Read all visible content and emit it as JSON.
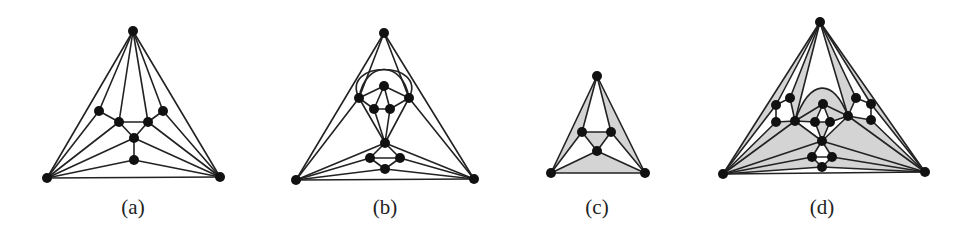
{
  "figure": {
    "panels": [
      {
        "id": "a",
        "label": "(a)",
        "label_pos": [
          133,
          214
        ],
        "nodes": [
          [
            133,
            31
          ],
          [
            47,
            178
          ],
          [
            220,
            177
          ],
          [
            99,
            111
          ],
          [
            119,
            122
          ],
          [
            148,
            122
          ],
          [
            163,
            111
          ],
          [
            134,
            138
          ],
          [
            134,
            160
          ]
        ],
        "edges": [
          [
            0,
            1
          ],
          [
            0,
            2
          ],
          [
            1,
            2
          ],
          [
            0,
            3
          ],
          [
            0,
            4
          ],
          [
            0,
            5
          ],
          [
            0,
            6
          ],
          [
            1,
            3
          ],
          [
            1,
            4
          ],
          [
            1,
            7
          ],
          [
            1,
            8
          ],
          [
            2,
            6
          ],
          [
            2,
            5
          ],
          [
            2,
            7
          ],
          [
            2,
            8
          ],
          [
            3,
            4
          ],
          [
            4,
            5
          ],
          [
            5,
            6
          ],
          [
            4,
            7
          ],
          [
            5,
            7
          ],
          [
            7,
            8
          ]
        ],
        "faces": [],
        "curves": []
      },
      {
        "id": "b",
        "label": "(b)",
        "label_pos": [
          385,
          214
        ],
        "nodes": [
          [
            384,
            33
          ],
          [
            296,
            180
          ],
          [
            474,
            179
          ],
          [
            359,
            98
          ],
          [
            409,
            98
          ],
          [
            384,
            86
          ],
          [
            374,
            109
          ],
          [
            390,
            109
          ],
          [
            385,
            143
          ],
          [
            370,
            158
          ],
          [
            400,
            158
          ],
          [
            385,
            169
          ]
        ],
        "edges": [
          [
            0,
            1
          ],
          [
            0,
            2
          ],
          [
            1,
            2
          ],
          [
            0,
            3
          ],
          [
            0,
            4
          ],
          [
            1,
            3
          ],
          [
            2,
            4
          ],
          [
            3,
            5
          ],
          [
            4,
            5
          ],
          [
            3,
            6
          ],
          [
            4,
            7
          ],
          [
            5,
            6
          ],
          [
            5,
            7
          ],
          [
            6,
            7
          ],
          [
            3,
            8
          ],
          [
            4,
            8
          ],
          [
            6,
            8
          ],
          [
            7,
            8
          ],
          [
            1,
            8
          ],
          [
            2,
            8
          ],
          [
            1,
            9
          ],
          [
            1,
            11
          ],
          [
            2,
            10
          ],
          [
            2,
            11
          ],
          [
            8,
            9
          ],
          [
            8,
            10
          ],
          [
            9,
            10
          ],
          [
            9,
            11
          ],
          [
            10,
            11
          ]
        ],
        "faces": [],
        "curves": [
          "M 359 98 C 365 60, 403 60, 409 98",
          "M 359 98 C 340 60, 428 60, 409 98"
        ]
      },
      {
        "id": "c",
        "label": "(c)",
        "label_pos": [
          597,
          214
        ],
        "nodes": [
          [
            597,
            76
          ],
          [
            551,
            173
          ],
          [
            645,
            173
          ],
          [
            582,
            132
          ],
          [
            611,
            132
          ],
          [
            597,
            151
          ]
        ],
        "edges": [
          [
            0,
            1
          ],
          [
            0,
            2
          ],
          [
            1,
            2
          ],
          [
            0,
            3
          ],
          [
            0,
            4
          ],
          [
            1,
            3
          ],
          [
            2,
            4
          ],
          [
            3,
            4
          ],
          [
            3,
            5
          ],
          [
            4,
            5
          ],
          [
            1,
            5
          ],
          [
            2,
            5
          ]
        ],
        "faces": [
          [
            0,
            1,
            3
          ],
          [
            0,
            2,
            4
          ],
          [
            3,
            4,
            5
          ],
          [
            1,
            2,
            5
          ]
        ],
        "curves": []
      },
      {
        "id": "d",
        "label": "(d)",
        "label_pos": [
          822,
          214
        ],
        "nodes": [
          [
            820,
            22
          ],
          [
            723,
            174
          ],
          [
            925,
            172
          ],
          [
            776,
            105
          ],
          [
            790,
            98
          ],
          [
            776,
            122
          ],
          [
            795,
            121
          ],
          [
            823,
            104
          ],
          [
            815,
            122
          ],
          [
            830,
            122
          ],
          [
            848,
            116
          ],
          [
            856,
            98
          ],
          [
            871,
            104
          ],
          [
            871,
            120
          ],
          [
            822,
            141
          ],
          [
            812,
            157
          ],
          [
            832,
            157
          ],
          [
            822,
            167
          ]
        ],
        "edges": [
          [
            0,
            1
          ],
          [
            0,
            2
          ],
          [
            1,
            2
          ],
          [
            0,
            3
          ],
          [
            0,
            4
          ],
          [
            0,
            6
          ],
          [
            0,
            10
          ],
          [
            0,
            11
          ],
          [
            0,
            12
          ],
          [
            1,
            3
          ],
          [
            1,
            5
          ],
          [
            1,
            6
          ],
          [
            1,
            14
          ],
          [
            1,
            15
          ],
          [
            1,
            17
          ],
          [
            2,
            12
          ],
          [
            2,
            13
          ],
          [
            2,
            10
          ],
          [
            2,
            14
          ],
          [
            2,
            16
          ],
          [
            2,
            17
          ],
          [
            3,
            4
          ],
          [
            3,
            5
          ],
          [
            4,
            6
          ],
          [
            5,
            6
          ],
          [
            6,
            8
          ],
          [
            6,
            7
          ],
          [
            7,
            8
          ],
          [
            7,
            9
          ],
          [
            8,
            9
          ],
          [
            9,
            10
          ],
          [
            7,
            10
          ],
          [
            10,
            11
          ],
          [
            11,
            12
          ],
          [
            12,
            13
          ],
          [
            10,
            13
          ],
          [
            8,
            14
          ],
          [
            9,
            14
          ],
          [
            6,
            14
          ],
          [
            10,
            14
          ],
          [
            14,
            15
          ],
          [
            14,
            16
          ],
          [
            15,
            16
          ],
          [
            15,
            17
          ],
          [
            16,
            17
          ]
        ],
        "faces": [
          [
            0,
            1,
            3
          ],
          [
            0,
            4,
            6
          ],
          [
            0,
            10,
            11
          ],
          [
            0,
            12,
            2
          ],
          [
            1,
            5,
            6
          ],
          [
            1,
            6,
            14
          ],
          [
            2,
            10,
            13
          ],
          [
            2,
            10,
            14
          ],
          [
            6,
            7,
            8
          ],
          [
            7,
            9,
            10
          ],
          [
            14,
            8,
            9
          ],
          [
            1,
            15,
            17
          ],
          [
            2,
            16,
            17
          ],
          [
            1,
            14,
            15
          ],
          [
            2,
            14,
            16
          ]
        ],
        "curves": [
          "M 795 121 C 810 78, 833 78, 848 116"
        ],
        "curve_fills": [
          "M 795 121 C 810 78, 833 78, 848 116 L 823 104 Z"
        ]
      }
    ]
  }
}
